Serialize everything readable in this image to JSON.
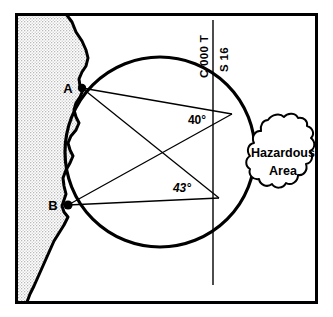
{
  "figure": {
    "type": "nautical-chart-diagram",
    "frame": {
      "x": 15,
      "y": 13,
      "width": 303,
      "height": 291,
      "stroke": "#000000",
      "stroke_width": 3
    },
    "background_color": "#ffffff",
    "land_color": "#e2e2e2",
    "ink_color": "#000000"
  },
  "land": {
    "label": "coastline-landmass",
    "fill": "#e2e2e2",
    "description": "Stippled land mass along left edge with irregular coastline"
  },
  "danger_circle": {
    "label": "danger-circle",
    "cx": 160,
    "cy": 152,
    "r": 95,
    "stroke": "#000000",
    "stroke_width": 3.2
  },
  "points": [
    {
      "id": "A",
      "label": "A",
      "x": 82,
      "y": 88,
      "marker": "filled-dot",
      "label_dx": -14,
      "label_dy": 4
    },
    {
      "id": "B",
      "label": "B",
      "x": 68,
      "y": 205,
      "marker": "filled-dot",
      "label_dx": -15,
      "label_dy": 4
    }
  ],
  "vertices": [
    {
      "id": "V1",
      "x": 232,
      "y": 114,
      "note": "upper angle vertex on circle"
    },
    {
      "id": "V2",
      "x": 219,
      "y": 198,
      "note": "lower angle vertex on circle"
    }
  ],
  "sight_lines": [
    {
      "from": "A",
      "to": "V1",
      "note": "A to upper vertex"
    },
    {
      "from": "A",
      "to": "V2",
      "note": "A to lower vertex"
    },
    {
      "from": "B",
      "to": "V1",
      "note": "B to upper vertex"
    },
    {
      "from": "B",
      "to": "V2",
      "note": "B to lower vertex"
    }
  ],
  "course_line": {
    "label": "course-line",
    "x": 213,
    "y1": 20,
    "y2": 285,
    "stroke": "#000000",
    "stroke_width": 1.4
  },
  "angles": [
    {
      "id": "upper",
      "value": "40°",
      "x": 197,
      "y": 124,
      "style": "upright"
    },
    {
      "id": "lower",
      "value": "43°",
      "x": 182,
      "y": 192,
      "style": "italic"
    }
  ],
  "bearing_labels": [
    {
      "id": "course",
      "text": "C 000 T",
      "x": 208,
      "y": 62,
      "rotation": -90
    },
    {
      "id": "speed",
      "text": "S 16",
      "x": 228,
      "y": 56,
      "rotation": -90
    }
  ],
  "hazard": {
    "label": "hazardous-area",
    "lines": [
      "Hazardous",
      "Area"
    ],
    "center_x": 283,
    "center_y": 160,
    "outline_stroke": "#000000",
    "outline_stroke_width": 2
  }
}
